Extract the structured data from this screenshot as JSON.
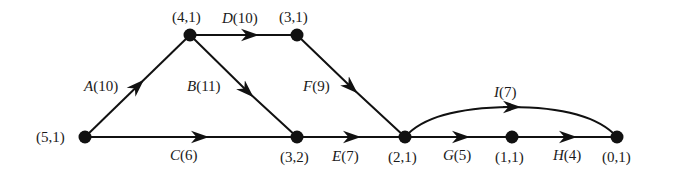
{
  "diagram": {
    "type": "activity-network",
    "nodes": [
      {
        "id": "n51",
        "label": "(5,1)",
        "x": 85,
        "y": 137
      },
      {
        "id": "n41",
        "label": "(4,1)",
        "x": 190,
        "y": 35
      },
      {
        "id": "n31",
        "label": "(3,1)",
        "x": 297,
        "y": 35
      },
      {
        "id": "n32",
        "label": "(3,2)",
        "x": 297,
        "y": 137
      },
      {
        "id": "n21",
        "label": "(2,1)",
        "x": 405,
        "y": 137
      },
      {
        "id": "n11",
        "label": "(1,1)",
        "x": 512,
        "y": 137
      },
      {
        "id": "n01",
        "label": "(0,1)",
        "x": 617,
        "y": 137
      }
    ],
    "edges": [
      {
        "id": "A",
        "name": "A",
        "weight": "(10)",
        "from": "n51",
        "to": "n41"
      },
      {
        "id": "B",
        "name": "B",
        "weight": "(11)",
        "from": "n41",
        "to": "n32"
      },
      {
        "id": "C",
        "name": "C",
        "weight": "(6)",
        "from": "n51",
        "to": "n32"
      },
      {
        "id": "D",
        "name": "D",
        "weight": "(10)",
        "from": "n41",
        "to": "n31"
      },
      {
        "id": "E",
        "name": "E",
        "weight": "(7)",
        "from": "n32",
        "to": "n21"
      },
      {
        "id": "F",
        "name": "F",
        "weight": "(9)",
        "from": "n31",
        "to": "n21"
      },
      {
        "id": "G",
        "name": "G",
        "weight": "(5)",
        "from": "n21",
        "to": "n11"
      },
      {
        "id": "H",
        "name": "H",
        "weight": "(4)",
        "from": "n11",
        "to": "n01"
      },
      {
        "id": "I",
        "name": "I",
        "weight": "(7)",
        "from": "n21",
        "to": "n01",
        "curved": true
      }
    ],
    "colors": {
      "line": "#111111",
      "node": "#111111",
      "text": "#1a1a1a",
      "background": "#ffffff"
    }
  }
}
